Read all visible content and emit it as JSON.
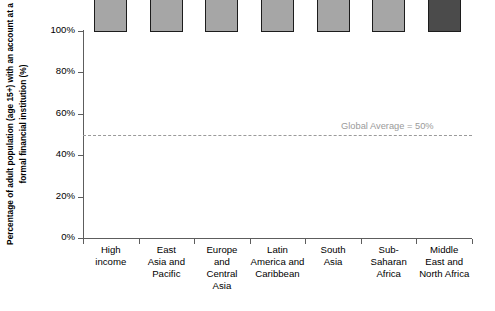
{
  "chart_data": {
    "type": "bar",
    "title": "",
    "subtitle": "",
    "xlabel": "",
    "ylabel": "Percentage of adult population (age 15+) with an account at a formal financial institution (%)",
    "ylim": [
      0,
      100
    ],
    "ytick_labels": [
      "0%",
      "20%",
      "40%",
      "60%",
      "80%",
      "100%"
    ],
    "ytick_values": [
      0,
      20,
      40,
      60,
      80,
      100
    ],
    "grid": false,
    "legend_position": "none",
    "categories": [
      "High income",
      "East Asia and Pacific",
      "Europe and Central Asia",
      "Latin America and Caribbean",
      "South Asia",
      "Sub-Saharan Africa",
      "Middle East and North Africa"
    ],
    "category_lines": [
      [
        "High",
        "income"
      ],
      [
        "East",
        "Asia and",
        "Pacific"
      ],
      [
        "Europe",
        "and",
        "Central",
        "Asia"
      ],
      [
        "Latin",
        "America and",
        "Caribbean"
      ],
      [
        "South",
        "Asia"
      ],
      [
        "Sub-",
        "Saharan",
        "Africa"
      ],
      [
        "Middle",
        "East and",
        "North Africa"
      ]
    ],
    "values": [
      89,
      55,
      45,
      39,
      33,
      24,
      18
    ],
    "value_labels": [
      "89%",
      "55%",
      "45%",
      "39%",
      "33%",
      "24%",
      "18%"
    ],
    "bar_colors": [
      "#a6a6a6",
      "#a6a6a6",
      "#a6a6a6",
      "#a6a6a6",
      "#a6a6a6",
      "#a6a6a6",
      "#4b4b4b"
    ],
    "bar_edge_color": "#1c1c1c",
    "annotations": [
      {
        "name": "global-average",
        "text": "Global Average = 50%",
        "value": 50,
        "color": "#9a9a9a",
        "style": "dashed-horizontal-line"
      }
    ]
  }
}
